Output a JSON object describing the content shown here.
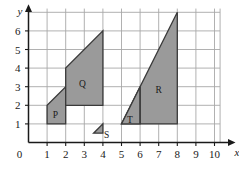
{
  "chart_data": {
    "type": "scatter",
    "title": "",
    "xlabel": "x",
    "ylabel": "y",
    "xlim": [
      0,
      10.6
    ],
    "ylim": [
      0,
      7.2
    ],
    "grid": true,
    "legend": "none",
    "x_ticks": [
      "0",
      "1",
      "2",
      "3",
      "4",
      "5",
      "6",
      "7",
      "8",
      "9",
      "10"
    ],
    "y_ticks": [
      "0",
      "1",
      "2",
      "3",
      "4",
      "5",
      "6"
    ],
    "x_tick_values": [
      0,
      1,
      2,
      3,
      4,
      5,
      6,
      7,
      8,
      9,
      10
    ],
    "y_tick_values": [
      0,
      1,
      2,
      3,
      4,
      5,
      6
    ],
    "origin_label": "0",
    "fill_color": "#9a9a9a",
    "outline_color": "#3a3a3a",
    "grid_color": "#a8a8a8",
    "axis_color": "#1a1a1a",
    "shapes": [
      {
        "name": "P",
        "label": "P",
        "kind": "trapezium",
        "points": [
          [
            1,
            1
          ],
          [
            2,
            1
          ],
          [
            2,
            3
          ],
          [
            1,
            2
          ]
        ],
        "label_at": [
          1.45,
          1.55
        ]
      },
      {
        "name": "Q",
        "label": "Q",
        "kind": "trapezium",
        "points": [
          [
            2,
            2
          ],
          [
            4,
            2
          ],
          [
            4,
            6
          ],
          [
            2,
            4
          ]
        ],
        "label_at": [
          2.9,
          3.2
        ]
      },
      {
        "name": "S",
        "label": "S",
        "kind": "triangle",
        "points": [
          [
            3.5,
            0.5
          ],
          [
            4,
            0.5
          ],
          [
            4,
            1
          ]
        ],
        "label_at": [
          4.2,
          0.45
        ]
      },
      {
        "name": "R",
        "label": "R",
        "kind": "triangle",
        "points": [
          [
            5,
            1
          ],
          [
            8,
            1
          ],
          [
            8,
            7
          ]
        ],
        "label_at": [
          7.0,
          2.9
        ]
      },
      {
        "name": "T",
        "label": "T",
        "kind": "triangle",
        "points": [
          [
            5,
            1
          ],
          [
            6,
            1
          ],
          [
            6,
            3
          ]
        ],
        "label_at": [
          5.45,
          1.25
        ]
      }
    ],
    "inner_edges": [
      {
        "name": "T-right-edge",
        "from": [
          6,
          1
        ],
        "to": [
          6,
          3
        ]
      }
    ]
  }
}
